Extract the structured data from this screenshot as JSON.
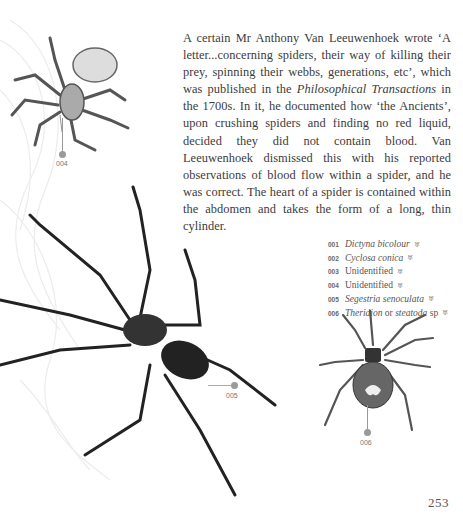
{
  "page": {
    "body_text": {
      "p1": "A certain Mr Anthony Van Leeuwenhoek wrote ‘A letter...concerning spiders, their way of killing their prey, spinning their webbs, generations, etc’, which was published in the ",
      "p1_italic": "Philosophical Transactions",
      "p2": " in the 1700s. In it, he documented how ‘the Ancients’, upon crushing spiders and finding no red liquid, decided they did not contain blood. Van Leeuwenhoek dismissed this with his reported observations of blood flow within a spider, and he was correct. The heart of a spider is contained within the abdomen and takes the form of a long, thin cylinder."
    },
    "legend": [
      {
        "num": "001",
        "name": "Dictyna bicolour",
        "italic": true
      },
      {
        "num": "002",
        "name": "Cyclosa conica",
        "italic": true
      },
      {
        "num": "003",
        "name": "Unidentified",
        "italic": false
      },
      {
        "num": "004",
        "name": "Unidentified",
        "italic": false
      },
      {
        "num": "005",
        "name": "Segestria senoculata",
        "italic": true
      },
      {
        "num": "006",
        "name_italic_a": "Theridion",
        "name_plain": " or ",
        "name_italic_b": "steatoda",
        "name_suffix": " sp",
        "italic": true
      }
    ],
    "legend_icon": "♅",
    "callouts": {
      "c004": "004",
      "c005": "005",
      "c006": "006"
    },
    "page_number": "253",
    "colors": {
      "text": "#3b3b3b",
      "callout_dot": "#9a9a9a"
    }
  }
}
